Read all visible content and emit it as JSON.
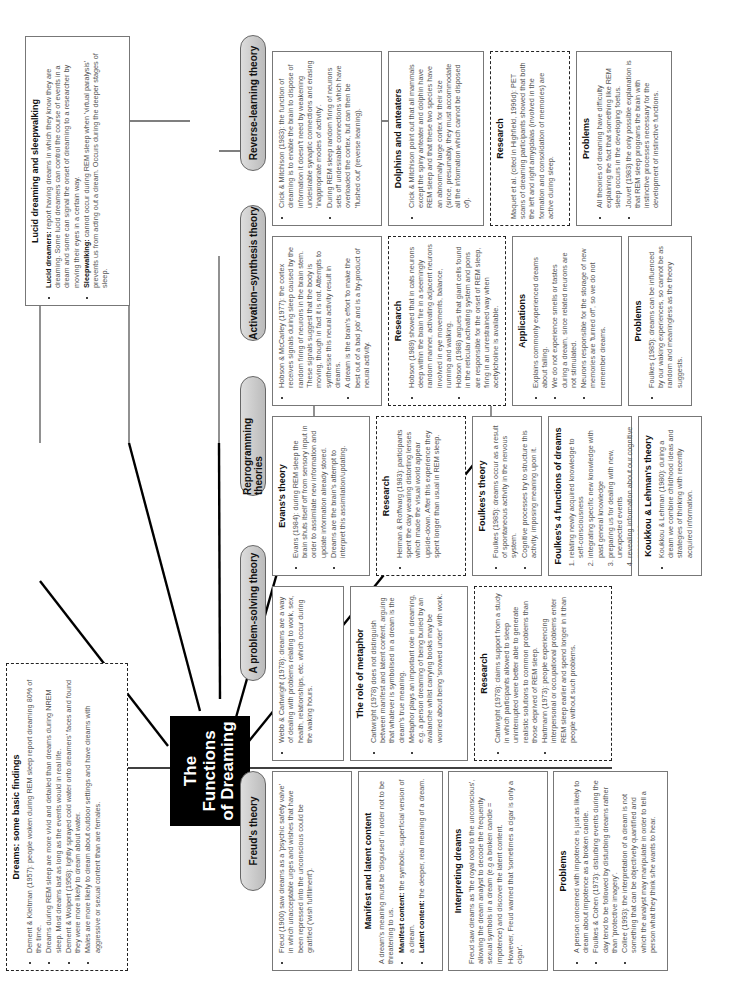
{
  "central": {
    "line1": "The Functions",
    "line2": "of Dreaming"
  },
  "basic_findings": {
    "title": "Dreams: some basic findings",
    "items": [
      "Dement & Kleitman (1957): people woken during REM sleep report dreaming 80% of the time.",
      "Dreams during REM sleep are more vivid and detailed than dreams during NREM sleep. Most dreams last as long as the events would in real life.",
      "Dement & Wolpert (1958): lightly sprayed cold water onto dreamers' faces and found they were more likely to dream about water.",
      "Males are more likely to dream about outdoor settings and have dreams with aggressive or sexual content than are females."
    ]
  },
  "lucid": {
    "title": "Lucid dreaming and sleepwalking",
    "items": [
      {
        "term": "Lucid dreamers:",
        "text": " report having dreams in which they know they are dreaming. Some lucid dreamers can control the course of events in a dream and some can signal the onset of dreaming to a researcher by moving their eyes in a certain way."
      },
      {
        "term": "Sleepwalking:",
        "text": " cannot occur during REM sleep when 'virtual paralysis' prevents us from acting out a dream. Occurs during the deeper stages of sleep."
      }
    ]
  },
  "freud": {
    "label": "Freud's theory",
    "main": "Freud (1900) saw dreams as a 'psychic safety valve' in which unacceptable urges and wishes that have been repressed into the unconscious could be gratified ('wish fulfillment').",
    "manifest": {
      "title": "Manifest and latent content",
      "intro": "A dream's meaning must be 'disguised' in order not to be threatening to us.",
      "items": [
        {
          "term": "Manifest content:",
          "text": " the symbolic, superficial version of a dream."
        },
        {
          "term": "Latent content:",
          "text": " the deeper, real meaning of a dream."
        }
      ]
    },
    "interpreting": {
      "title": "Interpreting dreams",
      "p1": "Freud saw dreams as 'the royal road to the unconscious', allowing the dream analyst to decode the frequently sexual symbols in a dream (e.g a broken candle = impotence) and discover the latent content.",
      "p2": "However, Freud warned that 'sometimes a cigar is only a cigar'."
    },
    "problems": {
      "title": "Problems",
      "items": [
        "A person concerned with impotence is just as likely to dream about impotence as a broken candle.",
        "Foulkes & Cohen (1973): disturbing events during the day tend to be followed by disturbing dreams rather than 'protective imagery'.",
        "Collee (1993): the interpretation of a dream is not something that can be objectively quantified and which the analyst may manipulate in order to tell a person what they think s/he wants to hear."
      ]
    }
  },
  "problem_solving": {
    "label": "A problem-solving theory",
    "main": "Webb & Cartwright (1978): dreams are a way of dealing with problems relating to work, sex, health, relationships, etc. which occur during the waking hours.",
    "metaphor": {
      "title": "The role of metaphor",
      "items": [
        "Cartwright (1978) does not distinguish between manifest and latent content, arguing that whatever is symbolised in a dream is the dream's true meaning.",
        "Metaphor plays an important role in dreaming, e.g. a person dreaming of being buried by an avalanche whilst carrying books may be worried about being 'snowed under' with work."
      ]
    },
    "research": {
      "title": "Research",
      "items": [
        "Cartwright (1978): claims support from a study in which participants allowed to sleep uninterrupted were better able to generate realistic solutions to common problems than those deprived of REM sleep.",
        "Hartmann (1973): people experiencing interpersonal or occupational problems enter REM sleep earlier and spend longer in it than people without such problems."
      ]
    }
  },
  "reprogramming": {
    "label": "Reprogramming theories",
    "evans": {
      "title": "Evans's theory",
      "items": [
        "Evans (1984): during REM sleep the brain shuts itself off from sensory input in order to assimilate new information and update information already stored.",
        "Dreams are the brain's attempt to interpret this assimilation/updating."
      ]
    },
    "research": {
      "title": "Research",
      "items": [
        "Herman & Roffwarg (1983): participants spent the day wearing distorting lenses which made the visual world appear upside-down. After this experience they spent longer than usual in REM sleep."
      ]
    },
    "foulkes": {
      "title": "Foulkes's theory",
      "items": [
        "Foulkes (1985): dreams occur as a result of spontaneous activity in the nervous system.",
        "Cognitive processes try to structure this activity, imposing meaning upon it."
      ]
    },
    "four_functions": {
      "title": "Foulkes's 4 functions of dreams",
      "items": [
        "relating newly acquired knowledge to self-consciousness",
        "integrating specific new knowledge with past general knowledge",
        "preparing us for dealing with new, unexpected events",
        "revealing information about our cognitive processes."
      ]
    },
    "koukkou": {
      "title": "Koukkou & Lehman's theory",
      "items": [
        "Koukkou & Lehman (1980): during a dream we combine childhood ideas and strategies of thinking with recently acquired information."
      ]
    }
  },
  "activation": {
    "label": "Activation–synthesis theory",
    "main": [
      "Hobson & McCarley (1977): the cortex receives signals during sleep caused by the random firing of neurons in the brain stem. These signals suggest that the body is moving, though in fact it is not. Attempts to synthesise this neural activity result in dreams.",
      "A dream is the brain's effort 'to make the best out of a bad job' and is a by-product of neural activity."
    ],
    "research": {
      "title": "Research",
      "items": [
        "Hobson (1989) showed that in cats neurons deep within the brain fire in a seemingly random manner, activating adjacent neurons involved in eye movements, balance, running and walking.",
        "Hobson (1988) argues that giant cells found in the reticular activating system and pons are responsible for the onset of REM sleep, firing in an unrestrained way when acetylcholine is available."
      ]
    },
    "applications": {
      "title": "Applications",
      "items": [
        "Explains commonly experienced dreams about falling.",
        "We do not experience smells or tastes during a dream, since related neurons are not stimulated.",
        "Neurons responsible for the storage of new memories are 'turned off', so we do not remember dreams."
      ]
    },
    "problems": {
      "title": "Problems",
      "items": [
        "Foulkes (1985): dreams can be influenced by our waking experiences, so cannot be as random and meaningless as the theory suggests."
      ]
    }
  },
  "reverse": {
    "label": "Reverse-learning theory",
    "main": [
      "Crick & Mitchison (1983): the function of dreaming is to enable the brain to dispose of information it doesn't need by weakening undesirable synaptic connections and erasing 'inappropriate modes of activity'.",
      "During REM sleep random firing of neurons sets off undesirable connections which have overloaded the cortex, but can then be 'flushed out' (reverse learning)."
    ],
    "dolphins": {
      "title": "Dolphins and anteaters",
      "items": [
        "Crick & Mitchison point out that all mammals except the spiny anteater and dolphin have REM sleep and that these two species have an abnormally large cortex for their size (since, presumably, they must accommodate all the information which cannot be disposed of)."
      ]
    },
    "research": {
      "title": "Research",
      "text": "Maquet et al. (cited in Highfield, 1996d): PET scans of dreaming participants showed that both the left and right amygdalas (involved in the formation and consolidation of memories) are active during sleep."
    },
    "problems": {
      "title": "Problems",
      "items": [
        "All theories of dreaming have difficulty explaining the fact that something like REM sleep occurs in the developing foetus.",
        "Jouvet (1983) the only possible explanation is that REM sleep programs the brain with instinctive processes necessary for the development of instinctive functions."
      ]
    }
  }
}
